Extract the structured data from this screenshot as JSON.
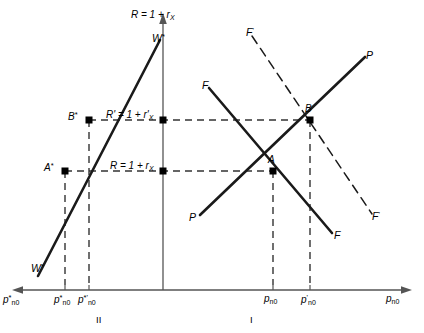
{
  "figure": {
    "background_color": "#ffffff",
    "line_color": "#1a1a1a",
    "axis_color": "#4d4d4d"
  },
  "axes": {
    "vertical_label": "R = 1 + r",
    "vertical_label_sub": "X",
    "right_axis_label": "p",
    "right_axis_label_sub": "n0",
    "left_axis_label": "p",
    "left_axis_label_sub": "n0",
    "left_axis_label_star": "*"
  },
  "levels": [
    {
      "id": "R-prime",
      "text": "R' = 1 + r'",
      "sub": "X",
      "y_value": 120
    },
    {
      "id": "R",
      "text": "R = 1 + r",
      "sub": "X",
      "y_value": 171
    }
  ],
  "curves": [
    {
      "id": "w-star-upper",
      "label": "W",
      "sup": "*",
      "style": "solid"
    },
    {
      "id": "w-star-lower",
      "label": "W",
      "sup": "*",
      "style": "solid"
    },
    {
      "id": "f-curve",
      "label": "F",
      "sup": "",
      "style": "solid"
    },
    {
      "id": "f-curve-end",
      "label": "F",
      "sup": "",
      "style": "solid"
    },
    {
      "id": "f-prime-curve",
      "label": "F",
      "sup": "'",
      "style": "dashed"
    },
    {
      "id": "f-prime-curve-end",
      "label": "F",
      "sup": "'",
      "style": "dashed"
    },
    {
      "id": "p-curve-upper",
      "label": "P",
      "sup": "",
      "style": "solid"
    },
    {
      "id": "p-curve-lower",
      "label": "P",
      "sup": "",
      "style": "solid"
    }
  ],
  "points": [
    {
      "id": "A-star",
      "label": "A",
      "sup": "*",
      "x": 65,
      "y": 171
    },
    {
      "id": "B-star",
      "label": "B",
      "sup": "*",
      "x": 89,
      "y": 120
    },
    {
      "id": "A",
      "label": "A",
      "sup": "",
      "x": 273,
      "y": 171
    },
    {
      "id": "B",
      "label": "B",
      "sup": "",
      "x": 310,
      "y": 120
    },
    {
      "id": "axis-R",
      "label": "",
      "sup": "",
      "x": 163,
      "y": 171
    },
    {
      "id": "axis-R-prime",
      "label": "",
      "sup": "",
      "x": 163,
      "y": 120
    }
  ],
  "ticks_left": [
    {
      "id": "p-star-n0",
      "base": "p",
      "sup": "*",
      "sub": "n0",
      "x": 65
    },
    {
      "id": "p-star-prime-n0",
      "base": "p",
      "sup": "*'",
      "sub": "n0",
      "x": 89
    }
  ],
  "ticks_right": [
    {
      "id": "p-n0",
      "base": "p",
      "sup": "",
      "sub": "n0",
      "x": 273
    },
    {
      "id": "p-prime-n0",
      "base": "p",
      "sup": "'",
      "sub": "n0",
      "x": 310
    }
  ],
  "quadrants": [
    {
      "id": "quadrant-II",
      "label": "II",
      "x": 100
    },
    {
      "id": "quadrant-I",
      "label": "I",
      "x": 250
    }
  ]
}
